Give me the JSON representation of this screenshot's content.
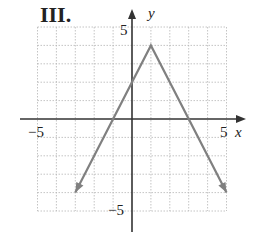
{
  "panel_label": "III.",
  "chart_data": {
    "type": "line",
    "title": "III.",
    "xlabel": "x",
    "ylabel": "y",
    "xlim": [
      -5,
      5
    ],
    "ylim": [
      -5,
      5
    ],
    "grid": true,
    "x_tick_labels": [
      "-5",
      "5"
    ],
    "y_tick_labels": [
      "5",
      "-5"
    ],
    "function": "y = -2|x - 1| + 4",
    "series": [
      {
        "name": "graph",
        "x": [
          -3,
          1,
          5
        ],
        "y": [
          -4,
          4,
          -4
        ],
        "arrows_at_ends": true,
        "color": "#808080"
      }
    ],
    "vertex": [
      1,
      4
    ],
    "x_intercepts": [
      -1,
      3
    ],
    "y_intercept": 2
  },
  "labels": {
    "x_axis": "x",
    "y_axis": "y",
    "x_min": "−5",
    "x_max": "5",
    "y_max": "5",
    "y_min": "−5"
  }
}
